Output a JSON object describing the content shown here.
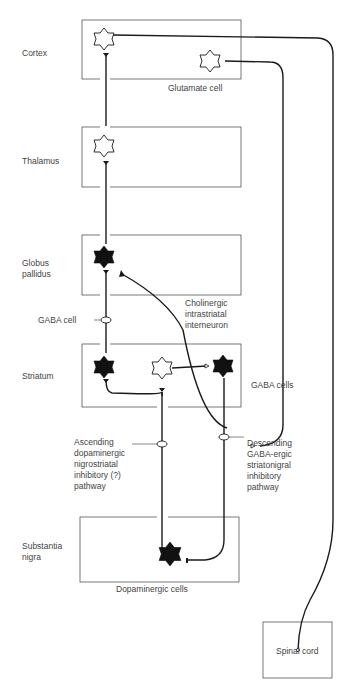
{
  "regions": {
    "cortex": "Cortex",
    "thalamus": "Thalamus",
    "globus_pallidus": [
      "Globus",
      "pallidus"
    ],
    "striatum": "Striatum",
    "substantia_nigra": [
      "Substantia",
      "nigra"
    ],
    "spinal_cord": "Spinal cord"
  },
  "cell_labels": {
    "glutamate": "Glutamate cell",
    "gaba_cell": "GABA cell",
    "gaba_cells": "GABA cells",
    "cholinergic": [
      "Cholinergic",
      "intrastriatal",
      "interneuron"
    ],
    "dopaminergic": "Dopaminergic cells"
  },
  "pathways": {
    "ascending": [
      "Ascending",
      "dopaminergic",
      "nigrostriatal",
      "inhibitory (?)",
      "pathway"
    ],
    "descending": [
      "Descending",
      "GABA-ergic",
      "striatonigral",
      "inhibitory",
      "pathway"
    ]
  },
  "colors": {
    "line": "#1a1a1a",
    "box": "#555555",
    "fill_dark": "#111111",
    "fill_light": "#ffffff"
  }
}
